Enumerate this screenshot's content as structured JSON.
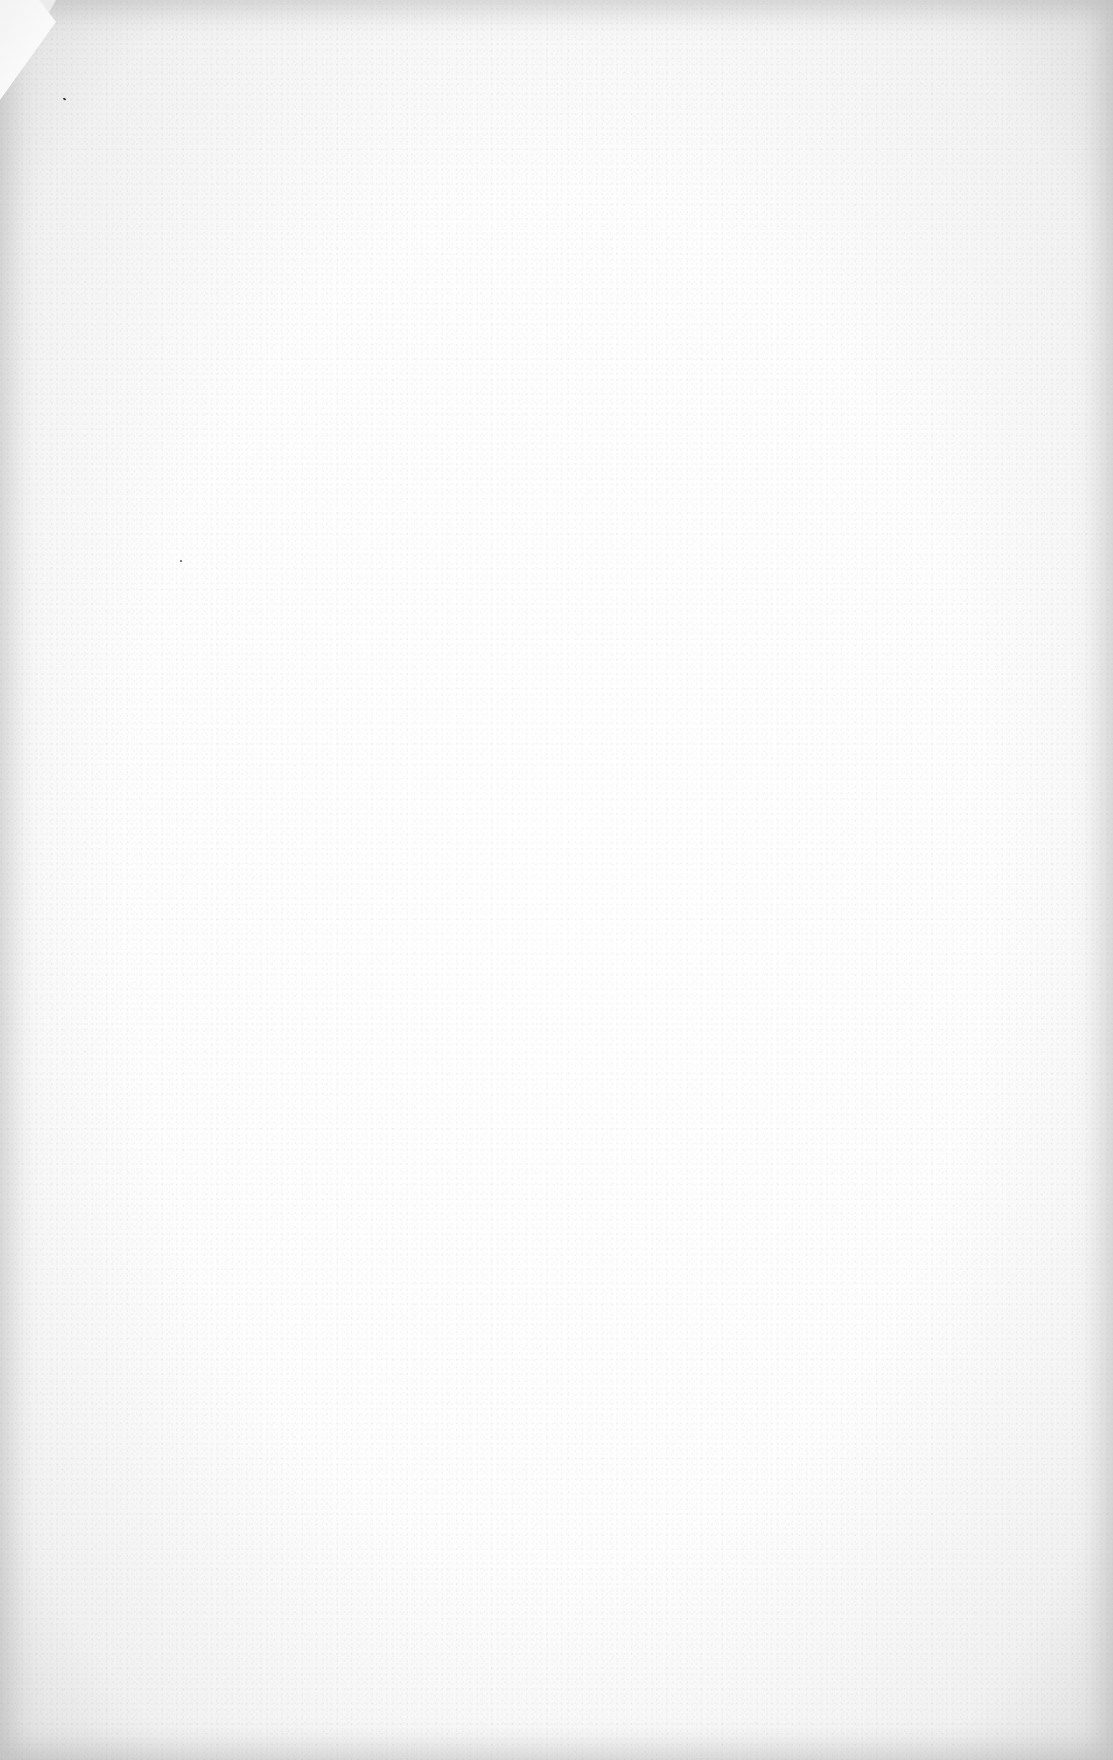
{
  "document": {
    "type": "blank scanned page",
    "text_content": "",
    "features": {
      "dog_eared_corner": "top-left",
      "paper_color": "#ffffff",
      "edge_tone": "#dedede"
    }
  }
}
